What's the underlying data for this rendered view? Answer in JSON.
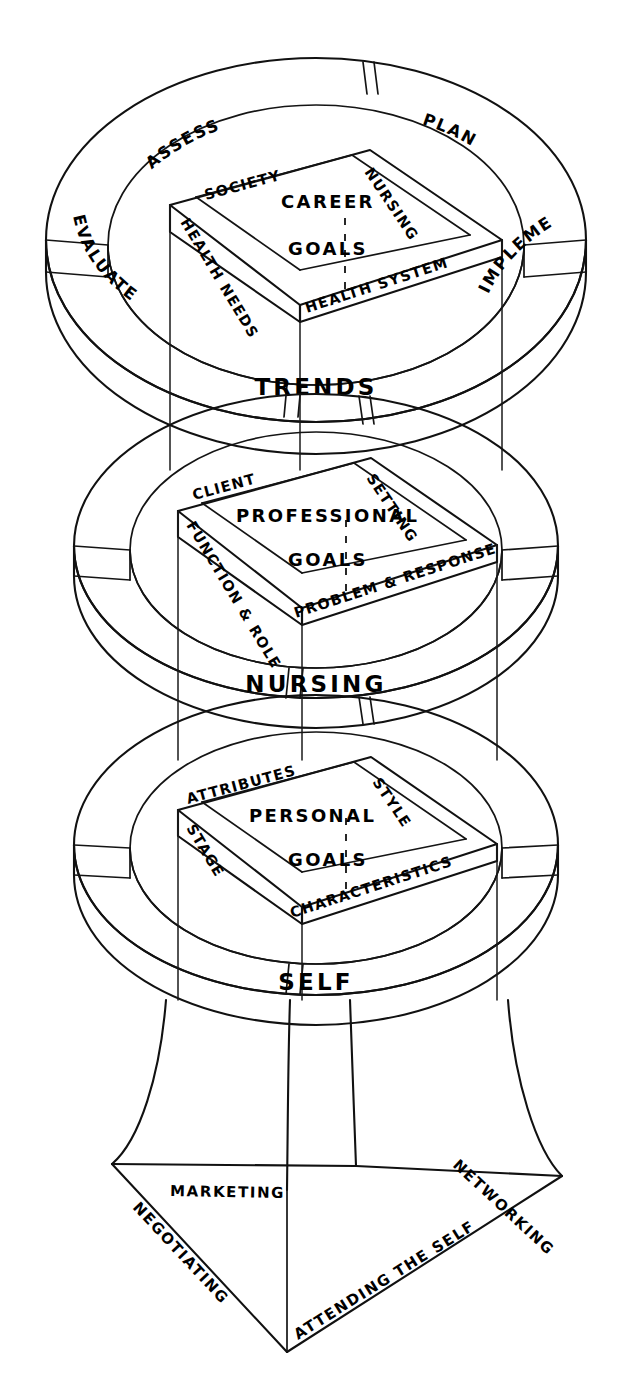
{
  "diagram": {
    "type": "three-tier-cylinder-diagram",
    "ink_color": "#111111",
    "background_color": "#ffffff"
  },
  "tiers": [
    {
      "id": "trends",
      "ring_label": "TRENDS",
      "core_line1": "CAREER",
      "core_line2": "GOALS",
      "outer_segments": [
        {
          "key": "assess",
          "label": "ASSESS"
        },
        {
          "key": "plan",
          "label": "PLAN"
        },
        {
          "key": "implement",
          "label": "IMPLEMENT"
        },
        {
          "key": "evaluate",
          "label": "EVALUATE"
        }
      ],
      "inner_faces": [
        {
          "key": "society",
          "label": "SOCIETY"
        },
        {
          "key": "nursing",
          "label": "NURSING"
        },
        {
          "key": "health-system",
          "label": "HEALTH SYSTEM"
        },
        {
          "key": "health-needs",
          "label": "HEALTH NEEDS"
        }
      ]
    },
    {
      "id": "nursing",
      "ring_label": "NURSING",
      "core_line1": "PROFESSIONAL",
      "core_line2": "GOALS",
      "outer_segments": [],
      "inner_faces": [
        {
          "key": "client",
          "label": "CLIENT"
        },
        {
          "key": "setting",
          "label": "SETTING"
        },
        {
          "key": "problem-response",
          "label": "PROBLEM & RESPONSE"
        },
        {
          "key": "function-role",
          "label": "FUNCTION & ROLE"
        }
      ]
    },
    {
      "id": "self",
      "ring_label": "SELF",
      "core_line1": "PERSONAL",
      "core_line2": "GOALS",
      "outer_segments": [],
      "inner_faces": [
        {
          "key": "attributes",
          "label": "ATTRIBUTES"
        },
        {
          "key": "style",
          "label": "STYLE"
        },
        {
          "key": "characteristics",
          "label": "CHARACTERISTICS"
        },
        {
          "key": "stage",
          "label": "STAGE"
        }
      ]
    }
  ],
  "base": {
    "id": "base-platform",
    "faces": [
      {
        "key": "marketing",
        "label": "MARKETING"
      },
      {
        "key": "networking",
        "label": "NETWORKING"
      },
      {
        "key": "negotiating",
        "label": "NEGOTIATING"
      },
      {
        "key": "attending-the-self",
        "label": "ATTENDING THE SELF"
      }
    ]
  }
}
